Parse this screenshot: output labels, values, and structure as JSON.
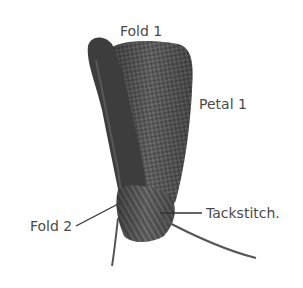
{
  "figure": {
    "labels": {
      "fold1": "Fold 1",
      "petal1": "Petal 1",
      "fold2": "Fold 2",
      "tackstitch": "Tackstitch."
    },
    "colors": {
      "background": "#ffffff",
      "ribbon_dark": "#3a3a3a",
      "ribbon_mid": "#5e5e5e",
      "ribbon_light": "#8a8a8a",
      "label_text": "#4a4a4a",
      "leader_line": "#333333"
    }
  }
}
